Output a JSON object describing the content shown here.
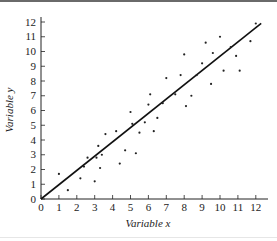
{
  "chart_data": {
    "type": "scatter",
    "title": "",
    "xlabel": "Variable x",
    "ylabel": "Variable y",
    "xlim": [
      0,
      12.5
    ],
    "ylim": [
      0,
      12.3
    ],
    "grid": false,
    "legend": null,
    "x_ticks": [
      0,
      1,
      2,
      3,
      4,
      5,
      6,
      7,
      8,
      9,
      10,
      11,
      12
    ],
    "y_ticks": [
      0,
      1,
      2,
      3,
      4,
      5,
      6,
      7,
      8,
      9,
      10,
      11,
      12
    ],
    "series": [
      {
        "name": "observations",
        "marker": "dot",
        "points": [
          [
            1.0,
            1.7
          ],
          [
            1.5,
            0.6
          ],
          [
            2.2,
            1.4
          ],
          [
            2.4,
            2.2
          ],
          [
            2.6,
            2.8
          ],
          [
            3.0,
            1.2
          ],
          [
            3.1,
            2.8
          ],
          [
            3.2,
            3.6
          ],
          [
            3.3,
            2.1
          ],
          [
            3.4,
            3.0
          ],
          [
            3.6,
            4.4
          ],
          [
            4.2,
            4.6
          ],
          [
            4.4,
            2.4
          ],
          [
            4.7,
            3.3
          ],
          [
            5.0,
            5.9
          ],
          [
            5.1,
            5.1
          ],
          [
            5.3,
            3.1
          ],
          [
            5.5,
            4.5
          ],
          [
            5.8,
            5.2
          ],
          [
            6.0,
            6.4
          ],
          [
            6.1,
            7.1
          ],
          [
            6.3,
            4.6
          ],
          [
            6.5,
            5.5
          ],
          [
            6.8,
            6.5
          ],
          [
            7.0,
            8.2
          ],
          [
            7.5,
            7.1
          ],
          [
            7.8,
            8.4
          ],
          [
            8.0,
            9.8
          ],
          [
            8.1,
            6.3
          ],
          [
            8.4,
            7.0
          ],
          [
            8.7,
            8.4
          ],
          [
            9.0,
            9.2
          ],
          [
            9.2,
            10.6
          ],
          [
            9.5,
            7.8
          ],
          [
            9.6,
            9.9
          ],
          [
            10.0,
            11.0
          ],
          [
            10.2,
            8.7
          ],
          [
            10.6,
            10.3
          ],
          [
            10.9,
            9.7
          ],
          [
            11.1,
            8.7
          ],
          [
            11.7,
            10.7
          ],
          [
            12.0,
            11.9
          ]
        ]
      },
      {
        "name": "fitted line",
        "type": "line",
        "points": [
          [
            0,
            0
          ],
          [
            12.3,
            11.9
          ]
        ]
      }
    ]
  },
  "colors": {
    "axis": "#222222",
    "points": "#222222",
    "line": "#111111"
  }
}
